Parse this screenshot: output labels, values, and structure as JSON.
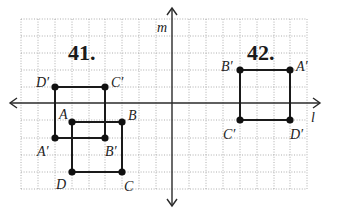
{
  "problems": [
    {
      "id": "41",
      "label": "41."
    },
    {
      "id": "42",
      "label": "42."
    }
  ],
  "axes": {
    "horizontal_label": "l",
    "vertical_label": "m"
  },
  "grid": {
    "cell_px": 16.8,
    "columns": 17,
    "rows": 10,
    "color": "#9a9a9a"
  },
  "figures": {
    "p41_original": {
      "name": "ABCD",
      "vertices": [
        {
          "label": "A",
          "grid": [
            -6,
            -1
          ]
        },
        {
          "label": "B",
          "grid": [
            -3,
            -1
          ]
        },
        {
          "label": "C",
          "grid": [
            -3,
            -4
          ]
        },
        {
          "label": "D",
          "grid": [
            -6,
            -4
          ]
        }
      ]
    },
    "p41_image": {
      "name": "A'B'C'D'",
      "vertices": [
        {
          "label": "A′",
          "grid": [
            -7,
            -2
          ]
        },
        {
          "label": "B′",
          "grid": [
            -4,
            -2
          ]
        },
        {
          "label": "C′",
          "grid": [
            -4,
            1
          ]
        },
        {
          "label": "D′",
          "grid": [
            -7,
            1
          ]
        }
      ]
    },
    "p42_image": {
      "name": "A'B'C'D'",
      "vertices": [
        {
          "label": "A′",
          "grid": [
            7,
            2
          ]
        },
        {
          "label": "B′",
          "grid": [
            4,
            2
          ]
        },
        {
          "label": "C′",
          "grid": [
            4,
            -1
          ]
        },
        {
          "label": "D′",
          "grid": [
            7,
            -1
          ]
        }
      ]
    }
  },
  "labels": {
    "p41": {
      "A": "A",
      "B": "B",
      "C": "C",
      "D": "D",
      "Ap": "A′",
      "Bp": "B′",
      "Cp": "C′",
      "Dp": "D′"
    },
    "p42": {
      "Ap": "A′",
      "Bp": "B′",
      "Cp": "C′",
      "Dp": "D′"
    }
  }
}
